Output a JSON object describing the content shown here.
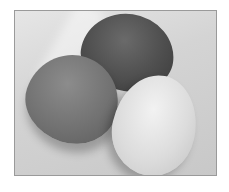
{
  "image": {
    "description": "Grayscale photograph of three eggs (dark, medium, light) on a light surface",
    "eggs": [
      {
        "tone": "dark",
        "color": "#4e4e4e"
      },
      {
        "tone": "medium",
        "color": "#727272"
      },
      {
        "tone": "light",
        "color": "#dcdcdc"
      }
    ],
    "border_color": "#9a9a9a"
  }
}
